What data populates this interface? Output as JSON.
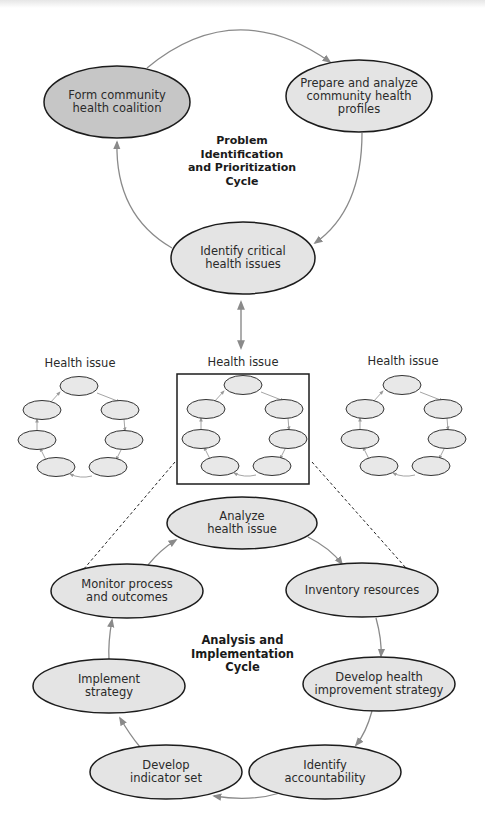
{
  "colors": {
    "dark_fill": "#c6c6c6",
    "light_fill": "#e4e4e4",
    "outline": "#1c1c1c",
    "arrow": "#8a8a8a"
  },
  "top_cycle": {
    "title_lines": [
      "Problem",
      "Identification",
      "and Prioritization",
      "Cycle"
    ],
    "nodes": [
      {
        "id": "form",
        "lines": [
          "Form community",
          "health coalition"
        ]
      },
      {
        "id": "prepare",
        "lines": [
          "Prepare and analyze",
          "community health",
          "profiles"
        ]
      },
      {
        "id": "identify",
        "lines": [
          "Identify critical",
          "health issues"
        ]
      }
    ]
  },
  "health_issues": {
    "labels": [
      "Health issue",
      "Health issue",
      "Health issue"
    ]
  },
  "bottom_cycle": {
    "title_lines": [
      "Analysis and",
      "Implementation",
      "Cycle"
    ],
    "nodes": [
      {
        "id": "analyze",
        "lines": [
          "Analyze",
          "health issue"
        ]
      },
      {
        "id": "inventory",
        "lines": [
          "Inventory resources"
        ]
      },
      {
        "id": "develop-strategy",
        "lines": [
          "Develop health",
          "improvement strategy"
        ]
      },
      {
        "id": "accountability",
        "lines": [
          "Identify",
          "accountability"
        ]
      },
      {
        "id": "indicator",
        "lines": [
          "Develop",
          "indicator set"
        ]
      },
      {
        "id": "implement",
        "lines": [
          "Implement",
          "strategy"
        ]
      },
      {
        "id": "monitor",
        "lines": [
          "Monitor process",
          "and outcomes"
        ]
      }
    ]
  }
}
